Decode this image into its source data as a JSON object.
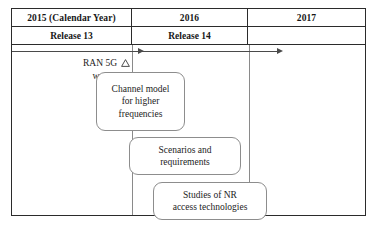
{
  "figure": {
    "name": "3GPP 5G standardization timeline",
    "columns": [
      {
        "year_label": "2015 (Calendar Year)",
        "release_label": "Release 13"
      },
      {
        "year_label": "2016",
        "release_label": "Release 14"
      },
      {
        "year_label": "2017",
        "release_label": ""
      }
    ],
    "event_marker": {
      "line1": "RAN 5G",
      "line2": "workshop",
      "icon": "triangle-marker"
    },
    "arrows": [
      {
        "name": "release-13-arrow"
      },
      {
        "name": "release-14-arrow"
      }
    ],
    "activity_boxes": [
      {
        "id": "channel-model",
        "lines": [
          "Channel model",
          "for higher",
          "frequencies"
        ]
      },
      {
        "id": "scenarios-requirements",
        "lines": [
          "Scenarios and",
          "requirements"
        ]
      },
      {
        "id": "studies-nr-access",
        "lines": [
          "Studies of NR",
          "access technologies"
        ]
      }
    ],
    "colors": {
      "frame": "#2b2b2b",
      "divider": "#8a8a8a",
      "box_border": "#8d8d8d",
      "text": "#1c1c1c",
      "background": "#ffffff"
    }
  }
}
